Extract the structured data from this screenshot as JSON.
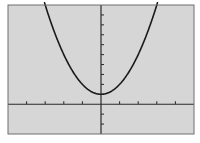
{
  "screen": {
    "background": "#d6d6d6",
    "frame_color": "#6e6e6e",
    "axis_color": "#2a2a2a",
    "curve_color": "#1a1a1a"
  },
  "chart_data": {
    "type": "line",
    "title": "",
    "xlabel": "",
    "ylabel": "",
    "function": "y = x^2 + 1",
    "xlim": [
      -5,
      5
    ],
    "ylim": [
      -3,
      10
    ],
    "xscl": 1,
    "yscl": 1,
    "grid": false,
    "legend": null,
    "series": [
      {
        "name": "y = x^2 + 1",
        "x": [
          -3,
          -2.5,
          -2,
          -1.5,
          -1,
          -0.5,
          0,
          0.5,
          1,
          1.5,
          2,
          2.5,
          3
        ],
        "y": [
          10,
          7.25,
          5,
          3.25,
          2,
          1.25,
          1,
          1.25,
          2,
          3.25,
          5,
          7.25,
          10
        ]
      }
    ],
    "x_ticks": [
      -4,
      -3,
      -2,
      -1,
      1,
      2,
      3,
      4
    ],
    "y_ticks": [
      -2,
      -1,
      1,
      2,
      3,
      4,
      5,
      6,
      7,
      8,
      9
    ]
  }
}
